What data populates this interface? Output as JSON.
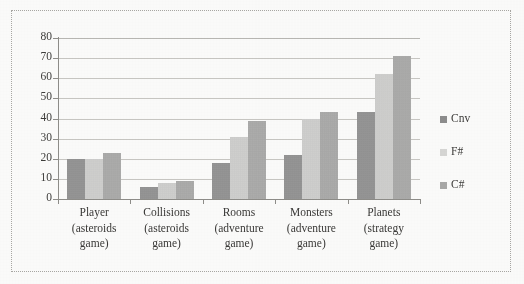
{
  "chart_data": {
    "type": "bar",
    "title": "",
    "subtitle": "",
    "xlabel": "",
    "ylabel": "",
    "ylim": [
      0,
      80
    ],
    "y_ticks": [
      0,
      10,
      20,
      30,
      40,
      50,
      60,
      70,
      80
    ],
    "y_tick_labels": [
      "0",
      "10",
      "20",
      "30",
      "40",
      "50",
      "60",
      "70",
      "80"
    ],
    "grid": true,
    "legend_position": "right",
    "categories": [
      "Player (asteroids game)",
      "Collisions (asteroids game)",
      "Rooms (adventure game)",
      "Monsters (adventure game)",
      "Planets (strategy game)"
    ],
    "category_lines": [
      [
        "Player",
        "(asteroids",
        "game)"
      ],
      [
        "Collisions",
        "(asteroids",
        "game)"
      ],
      [
        "Rooms",
        "(adventure",
        "game)"
      ],
      [
        "Monsters",
        "(adventure",
        "game)"
      ],
      [
        "Planets",
        "(strategy",
        "game)"
      ]
    ],
    "series": [
      {
        "name": "Cnv",
        "color": "#8e8e8e",
        "values": [
          20,
          6,
          18,
          22,
          43
        ]
      },
      {
        "name": "F#",
        "color": "#d4d4d2",
        "values": [
          20,
          8,
          31,
          40,
          62
        ]
      },
      {
        "name": "C#",
        "color": "#a9a9a8",
        "values": [
          23,
          9,
          39,
          43,
          71
        ]
      }
    ]
  },
  "legend": {
    "entries": [
      {
        "label": "Cnv"
      },
      {
        "label": "F#"
      },
      {
        "label": "C#"
      }
    ]
  }
}
